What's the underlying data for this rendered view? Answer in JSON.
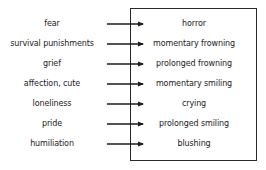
{
  "diagram": {
    "type": "mapping",
    "causes": [
      {
        "label": "fear",
        "y": 24
      },
      {
        "label": "survival punishments",
        "y": 44
      },
      {
        "label": "grief",
        "y": 64
      },
      {
        "label": "affection, cute",
        "y": 84
      },
      {
        "label": "loneliness",
        "y": 104
      },
      {
        "label": "pride",
        "y": 124
      },
      {
        "label": "humiliation",
        "y": 144
      }
    ],
    "expressions": [
      {
        "label": "horror",
        "y": 24
      },
      {
        "label": "momentary frowning",
        "y": 44
      },
      {
        "label": "prolonged frowning",
        "y": 64
      },
      {
        "label": "momentary smiling",
        "y": 84
      },
      {
        "label": "crying",
        "y": 104
      },
      {
        "label": "prolonged smiling",
        "y": 124
      },
      {
        "label": "blushing",
        "y": 144
      }
    ],
    "arrow_color": "#1a1a1a"
  }
}
